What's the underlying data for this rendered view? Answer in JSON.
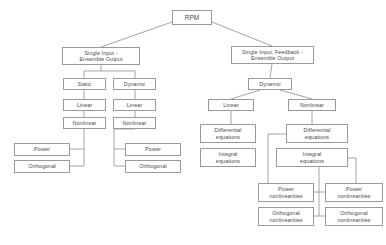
{
  "diagram": {
    "colors": {
      "box_border": "#9a9a9a",
      "box_fill": "#ffffff",
      "edge": "#8d8d8d",
      "text": "#4a4a4a",
      "background": "#ffffff"
    },
    "nodes": [
      {
        "id": "rpm",
        "label": "RPM",
        "x": 172,
        "y": 10,
        "w": 40,
        "h": 15,
        "font": 6.5
      },
      {
        "id": "si-eo",
        "label": "Single Input -\nEnsemble Output",
        "x": 62,
        "y": 47,
        "w": 78,
        "h": 18,
        "font": 5.4
      },
      {
        "id": "sif-eo",
        "label": "Single Input, Feedback -\nEnsemble Output",
        "x": 231,
        "y": 46,
        "w": 83,
        "h": 18,
        "font": 5.4
      },
      {
        "id": "static",
        "label": "Static",
        "x": 63,
        "y": 78,
        "w": 43,
        "h": 12,
        "font": 5.4
      },
      {
        "id": "dynamic-l",
        "label": "Dynamic",
        "x": 113,
        "y": 78,
        "w": 43,
        "h": 12,
        "font": 5.4
      },
      {
        "id": "dynamic-r",
        "label": "Dynamic",
        "x": 248,
        "y": 78,
        "w": 44,
        "h": 12,
        "font": 5.4
      },
      {
        "id": "linear-1",
        "label": "Linear",
        "x": 63,
        "y": 99,
        "w": 43,
        "h": 12,
        "font": 5.4
      },
      {
        "id": "nonlinear-1",
        "label": "Nonlinear",
        "x": 63,
        "y": 117,
        "w": 43,
        "h": 12,
        "font": 5.4
      },
      {
        "id": "linear-2",
        "label": "Linear",
        "x": 113,
        "y": 99,
        "w": 43,
        "h": 12,
        "font": 5.4
      },
      {
        "id": "nonlinear-2",
        "label": "Nonlinear",
        "x": 113,
        "y": 117,
        "w": 43,
        "h": 12,
        "font": 5.4
      },
      {
        "id": "power-1",
        "label": "Power",
        "x": 14,
        "y": 143,
        "w": 56,
        "h": 13,
        "font": 5.4
      },
      {
        "id": "orthogonal-1",
        "label": "Orthogonal",
        "x": 14,
        "y": 160,
        "w": 56,
        "h": 13,
        "font": 5.4
      },
      {
        "id": "power-2",
        "label": "Power",
        "x": 125,
        "y": 143,
        "w": 56,
        "h": 13,
        "font": 5.4
      },
      {
        "id": "orthogonal-2",
        "label": "Orthogonal",
        "x": 125,
        "y": 160,
        "w": 56,
        "h": 13,
        "font": 5.4
      },
      {
        "id": "linear-3",
        "label": "Linear",
        "x": 208,
        "y": 99,
        "w": 46,
        "h": 12,
        "font": 5.4
      },
      {
        "id": "nonlinear-3",
        "label": "Nonlinear",
        "x": 288,
        "y": 99,
        "w": 48,
        "h": 12,
        "font": 5.4
      },
      {
        "id": "diff-eq-1",
        "label": "Differential\nequations",
        "x": 200,
        "y": 124,
        "w": 56,
        "h": 19,
        "font": 5.4
      },
      {
        "id": "integ-eq-1",
        "label": "Integral\nequations",
        "x": 200,
        "y": 148,
        "w": 56,
        "h": 19,
        "font": 5.4
      },
      {
        "id": "diff-eq-2",
        "label": "Differential\nequations",
        "x": 286,
        "y": 124,
        "w": 62,
        "h": 19,
        "font": 5.4
      },
      {
        "id": "integ-eq-2",
        "label": "Integral\nequations",
        "x": 276,
        "y": 148,
        "w": 72,
        "h": 19,
        "font": 5.4
      },
      {
        "id": "power-nl-1",
        "label": "Power\nnonlinearities",
        "x": 258,
        "y": 183,
        "w": 56,
        "h": 19,
        "font": 5.4
      },
      {
        "id": "orthogonal-nl-1",
        "label": "Orthogonal\nnonlinearities",
        "x": 258,
        "y": 207,
        "w": 56,
        "h": 19,
        "font": 5.4
      },
      {
        "id": "power-nl-2",
        "label": "Power\nnonlinearities",
        "x": 325,
        "y": 183,
        "w": 58,
        "h": 19,
        "font": 5.4
      },
      {
        "id": "orthogonal-nl-2",
        "label": "Orthogonal\nnonlinearities",
        "x": 325,
        "y": 207,
        "w": 58,
        "h": 19,
        "font": 5.4
      }
    ],
    "edges": [
      {
        "id": "rpm-to-si-eo",
        "points": "172,22 101,47"
      },
      {
        "id": "rpm-to-sif-eo",
        "points": "212,22 272,46"
      },
      {
        "id": "si-eo-stem",
        "points": "101,65 101,71"
      },
      {
        "id": "si-eo-bus",
        "points": "84,71 135,71"
      },
      {
        "id": "si-eo-to-static",
        "points": "84,71 84,78"
      },
      {
        "id": "si-eo-to-dynamic",
        "points": "135,71 135,78"
      },
      {
        "id": "static-to-linear1",
        "points": "84,90 84,99"
      },
      {
        "id": "linear1-to-nonlin1",
        "points": "84,111 84,117"
      },
      {
        "id": "dynamic-to-linear2",
        "points": "135,90 135,99"
      },
      {
        "id": "linear2-to-nonlin2",
        "points": "135,111 135,117"
      },
      {
        "id": "nonlin1-drop",
        "points": "84,129 84,166"
      },
      {
        "id": "nonlin1-to-power",
        "points": "84,149 70,149"
      },
      {
        "id": "nonlin1-to-orth",
        "points": "84,166 70,166"
      },
      {
        "id": "nonlin2-drop",
        "points": "135,129 114,129 114,166"
      },
      {
        "id": "nonlin2-to-power",
        "points": "114,149 125,149"
      },
      {
        "id": "nonlin2-to-orth",
        "points": "114,166 125,166"
      },
      {
        "id": "sif-eo-to-dynamicr",
        "points": "272,64 270,78"
      },
      {
        "id": "dynamicr-to-linear3",
        "points": "260,90 231,99"
      },
      {
        "id": "dynamicr-to-nonlin3",
        "points": "280,90 312,99"
      },
      {
        "id": "linear3-to-diff1",
        "points": "231,111 231,124"
      },
      {
        "id": "nonlin3-to-diff2",
        "points": "312,111 312,124"
      },
      {
        "id": "diff2-left-drop",
        "points": "286,134 268,134 268,192"
      },
      {
        "id": "diff2-to-powernl1",
        "points": "268,192 258,192"
      },
      {
        "id": "diff2-to-orthnl1",
        "points": "268,216 258,216"
      },
      {
        "id": "diff2-left-drop2",
        "points": "268,216 268,216"
      },
      {
        "id": "integ2-right-drop",
        "points": "348,158 356,158 356,192"
      },
      {
        "id": "integ2-to-powernl2",
        "points": "356,192 383,192"
      },
      {
        "id": "nl-inner-bus",
        "points": "319,167 319,216"
      },
      {
        "id": "nl-inner-to-pnl1",
        "points": "319,192 314,192"
      },
      {
        "id": "nl-inner-to-pnl2",
        "points": "319,192 325,192"
      },
      {
        "id": "nl-inner-to-onl1",
        "points": "319,216 314,216"
      },
      {
        "id": "nl-inner-to-onl2",
        "points": "319,216 325,216"
      }
    ]
  }
}
